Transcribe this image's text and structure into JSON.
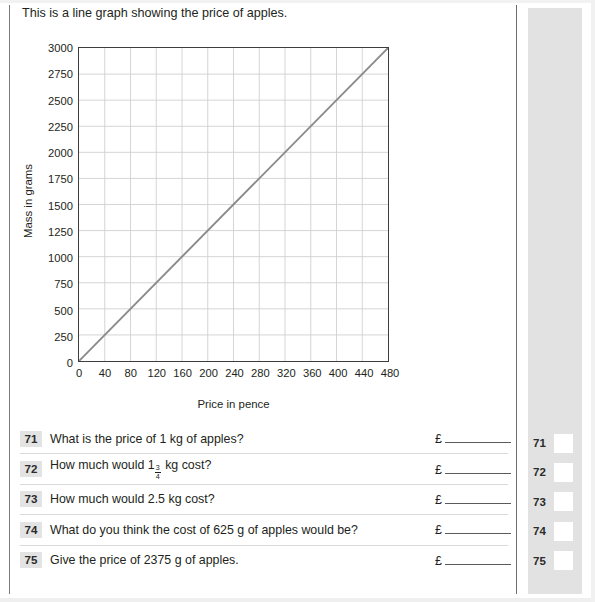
{
  "intro": "This is a line graph showing the price of apples.",
  "chart_data": {
    "type": "line",
    "title": "",
    "xlabel": "Price in pence",
    "ylabel": "Mass in grams",
    "xlim": [
      0,
      480
    ],
    "ylim": [
      0,
      3000
    ],
    "xticks": [
      0,
      40,
      80,
      120,
      160,
      200,
      240,
      280,
      320,
      360,
      400,
      440,
      480
    ],
    "yticks": [
      0,
      250,
      500,
      750,
      1000,
      1250,
      1500,
      1750,
      2000,
      2250,
      2500,
      2750,
      3000
    ],
    "grid": true,
    "legend": "none",
    "series": [
      {
        "name": "price of apples",
        "color": "#8a8a8a",
        "x": [
          0,
          480
        ],
        "values": [
          0,
          3000
        ]
      }
    ]
  },
  "questions": [
    {
      "number": "71",
      "text_before": "What is the price of 1 kg of apples?",
      "fraction": null,
      "text_after": "",
      "currency": "£"
    },
    {
      "number": "72",
      "text_before": "How much would 1",
      "fraction": {
        "numerator": "3",
        "denominator": "4"
      },
      "text_after": " kg cost?",
      "currency": "£"
    },
    {
      "number": "73",
      "text_before": "How much would 2.5 kg cost?",
      "fraction": null,
      "text_after": "",
      "currency": "£"
    },
    {
      "number": "74",
      "text_before": "What do you think the cost of 625 g of apples would be?",
      "fraction": null,
      "text_after": "",
      "currency": "£"
    },
    {
      "number": "75",
      "text_before": "Give the price of 2375 g of apples.",
      "fraction": null,
      "text_after": "",
      "currency": "£"
    }
  ],
  "marking_sidebar": {
    "rows": [
      {
        "number": "71"
      },
      {
        "number": "72"
      },
      {
        "number": "73"
      },
      {
        "number": "74"
      },
      {
        "number": "75"
      }
    ]
  },
  "colors": {
    "line": "#8a8a8a",
    "grid": "#d0d0d0",
    "axis": "#3d3d3d",
    "sidebar": "#e2e2e2",
    "qnum_bg": "#e3e3e3",
    "text": "#231f20"
  }
}
